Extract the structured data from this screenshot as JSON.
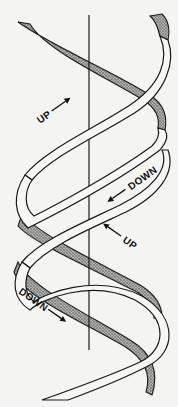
{
  "diagram": {
    "axis": {
      "x": 89,
      "y_top": 15,
      "y_bottom": 350
    },
    "colors": {
      "background": "#f4f4f2",
      "stroke": "#1a1a1a",
      "front_fill": "#f7f7f5",
      "back_fill": "#8a8a88"
    },
    "labels": [
      {
        "text": "UP",
        "arrow": "right",
        "x": 40,
        "y": 124,
        "rotate": -35
      },
      {
        "text": "DOWN",
        "arrow": "left",
        "x": 138,
        "y": 192,
        "rotate": -35
      },
      {
        "text": "UP",
        "arrow": "left",
        "x": 127,
        "y": 250,
        "rotate": 35
      },
      {
        "text": "DOWN",
        "arrow": "right",
        "x": 18,
        "y": 303,
        "rotate": 35
      }
    ]
  }
}
